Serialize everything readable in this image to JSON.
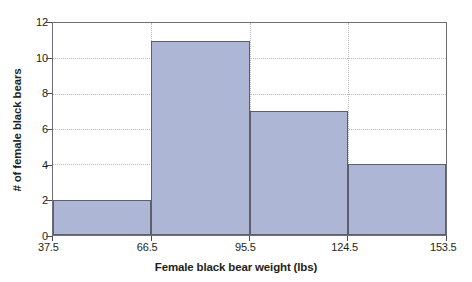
{
  "chart_data": {
    "type": "bar",
    "title": "",
    "subtitle": "",
    "xlabel": "Female black bear weight (lbs)",
    "ylabel": "# of female black bears",
    "bin_edges": [
      37.5,
      66.5,
      95.5,
      124.5,
      153.5
    ],
    "bin_width": 29,
    "categories": [
      "37.5-66.5",
      "66.5-95.5",
      "95.5-124.5",
      "124.5-153.5"
    ],
    "values": [
      2,
      11,
      7,
      4
    ],
    "xtick_labels": [
      "37.5",
      "66.5",
      "95.5",
      "124.5",
      "153.5"
    ],
    "ytick_labels": [
      "0",
      "2",
      "4",
      "6",
      "8",
      "10",
      "12"
    ],
    "ytick_values": [
      0,
      2,
      4,
      6,
      8,
      10,
      12
    ],
    "xlim": [
      37.5,
      153.5
    ],
    "ylim": [
      0,
      12
    ],
    "grid": "dotted-both",
    "legend": "none",
    "bar_fill_color": "#aeb6d6",
    "bar_edge_color": "#5d5f6d",
    "grid_color": "#b9b9bf",
    "axis_color": "#6e6e78",
    "background_color": "#ffffff"
  }
}
